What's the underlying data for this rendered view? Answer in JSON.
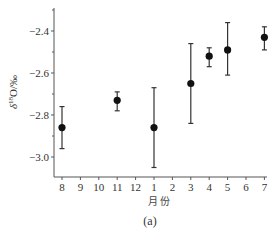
{
  "chart_data": {
    "type": "scatter",
    "title": "",
    "caption": "(a)",
    "xlabel": "月份",
    "ylabel": "δ18O/‰",
    "ylabel_parts": {
      "delta": "δ",
      "sup": "18",
      "rest": "O/‰"
    },
    "x_tick_labels": [
      "8",
      "9",
      "10",
      "11",
      "12",
      "1",
      "2",
      "3",
      "4",
      "5",
      "6",
      "7"
    ],
    "y_ticks": [
      -2.4,
      -2.6,
      -2.8,
      -3.0
    ],
    "y_tick_labels": [
      "−2.4",
      "−2.6",
      "−2.8",
      "−3.0"
    ],
    "y_minor_ticks": [
      -2.3,
      -2.5,
      -2.7,
      -2.9
    ],
    "ylim": [
      -3.095,
      -2.29
    ],
    "grid": false,
    "legend": null,
    "series": [
      {
        "name": "δ18O",
        "marker": "filled-circle",
        "error_bars": true,
        "points": [
          {
            "month": "8",
            "x_index": 0,
            "y": -2.86,
            "y_upper": -2.76,
            "y_lower": -2.96
          },
          {
            "month": "11",
            "x_index": 3,
            "y": -2.73,
            "y_upper": -2.69,
            "y_lower": -2.78
          },
          {
            "month": "1",
            "x_index": 5,
            "y": -2.86,
            "y_upper": -2.67,
            "y_lower": -3.05
          },
          {
            "month": "3",
            "x_index": 7,
            "y": -2.65,
            "y_upper": -2.46,
            "y_lower": -2.84
          },
          {
            "month": "4",
            "x_index": 8,
            "y": -2.52,
            "y_upper": -2.48,
            "y_lower": -2.57
          },
          {
            "month": "5",
            "x_index": 9,
            "y": -2.49,
            "y_upper": -2.36,
            "y_lower": -2.61
          },
          {
            "month": "7",
            "x_index": 11,
            "y": -2.43,
            "y_upper": -2.38,
            "y_lower": -2.49
          }
        ]
      }
    ]
  },
  "layout": {
    "plot_left": 54,
    "plot_right": 267,
    "plot_top": 8,
    "plot_bottom": 177,
    "x_first_px": 62,
    "x_step_px": 18.4,
    "y_ref_value": -2.4,
    "y_ref_px": 31,
    "px_per_unit": 210
  }
}
